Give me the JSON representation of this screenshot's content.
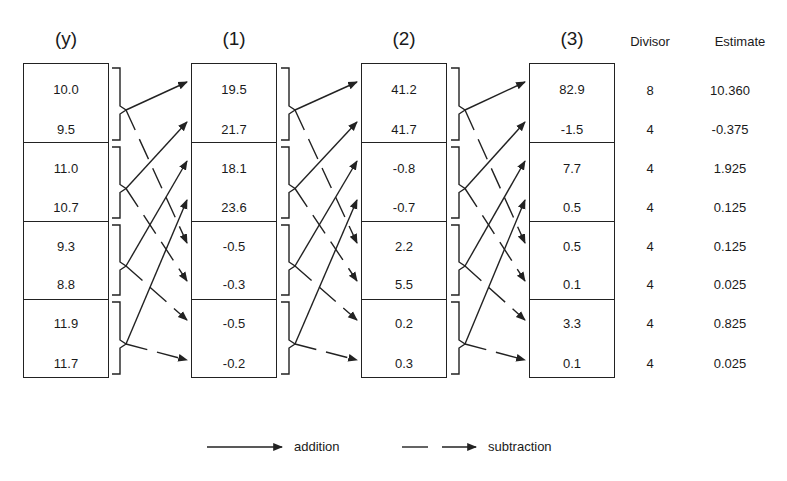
{
  "headers": {
    "y": "(y)",
    "c1": "(1)",
    "c2": "(2)",
    "c3": "(3)",
    "divisor": "Divisor",
    "estimate": "Estimate"
  },
  "columns": {
    "y": [
      "10.0",
      "9.5",
      "11.0",
      "10.7",
      "9.3",
      "8.8",
      "11.9",
      "11.7"
    ],
    "c1": [
      "19.5",
      "21.7",
      "18.1",
      "23.6",
      "-0.5",
      "-0.3",
      "-0.5",
      "-0.2"
    ],
    "c2": [
      "41.2",
      "41.7",
      "-0.8",
      "-0.7",
      "2.2",
      "5.5",
      "0.2",
      "0.3"
    ],
    "c3": [
      "82.9",
      "-1.5",
      "7.7",
      "0.5",
      "0.5",
      "0.1",
      "3.3",
      "0.1"
    ],
    "divisor": [
      "8",
      "4",
      "4",
      "4",
      "4",
      "4",
      "4",
      "4"
    ],
    "estimate": [
      "10.360",
      "-0.375",
      "1.925",
      "0.125",
      "0.125",
      "0.025",
      "0.825",
      "0.025"
    ]
  },
  "legend": {
    "addition": "addition",
    "subtraction": "subtraction"
  },
  "colors": {
    "ink": "#222222",
    "background": "#ffffff"
  }
}
